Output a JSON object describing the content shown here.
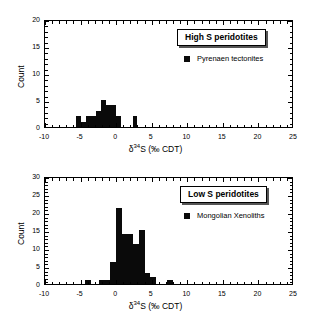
{
  "figure": {
    "background_color": "#ffffff",
    "bar_color": "#0a0a0a"
  },
  "chart_data": [
    {
      "type": "bar",
      "panel": "top",
      "title": "High S peridotites",
      "legend_entries": [
        "Pyrenaen tectonites"
      ],
      "legend_position": "upper-right",
      "xlabel_prefix": "δ",
      "xlabel_sup": "34",
      "xlabel_suffix": "S (‰ CDT)",
      "xlabel": "δ34S (‰ CDT)",
      "ylabel": "Count",
      "xlim": [
        -10,
        25
      ],
      "ylim": [
        0,
        20
      ],
      "xticks": [
        -10,
        -5,
        0,
        5,
        10,
        15,
        20,
        25
      ],
      "yticks": [
        0,
        5,
        10,
        15,
        20
      ],
      "xtick_labels": [
        "-10",
        "-5",
        "0",
        "5",
        "10",
        "15",
        "20",
        "25"
      ],
      "ytick_labels": [
        "0",
        "5",
        "10",
        "15",
        "20"
      ],
      "minor_tick_step_x": 1,
      "minor_tick_step_y": 1,
      "grid": false,
      "bin_width": 0.7,
      "bins": [
        {
          "x0": -5.6,
          "x1": -4.9,
          "value": 2
        },
        {
          "x0": -4.9,
          "x1": -4.2,
          "value": 1
        },
        {
          "x0": -4.2,
          "x1": -3.5,
          "value": 2
        },
        {
          "x0": -3.5,
          "x1": -2.8,
          "value": 2
        },
        {
          "x0": -2.8,
          "x1": -2.1,
          "value": 3
        },
        {
          "x0": -2.1,
          "x1": -1.4,
          "value": 5
        },
        {
          "x0": -1.4,
          "x1": -0.7,
          "value": 4
        },
        {
          "x0": -0.7,
          "x1": 0.0,
          "value": 4
        },
        {
          "x0": 0.0,
          "x1": 0.7,
          "value": 2
        },
        {
          "x0": 2.3,
          "x1": 3.0,
          "value": 2
        }
      ]
    },
    {
      "type": "bar",
      "panel": "bottom",
      "title": "Low S peridotites",
      "legend_entries": [
        "Mongolian Xenoliths"
      ],
      "legend_position": "upper-right",
      "xlabel_prefix": "δ",
      "xlabel_sup": "34",
      "xlabel_suffix": "S (‰ CDT)",
      "xlabel": "δ34S (‰ CDT)",
      "ylabel": "Count",
      "xlim": [
        -10,
        25
      ],
      "ylim": [
        0,
        30
      ],
      "xticks": [
        -10,
        -5,
        0,
        5,
        10,
        15,
        20,
        25
      ],
      "yticks": [
        0,
        5,
        10,
        15,
        20,
        25,
        30
      ],
      "xtick_labels": [
        "-10",
        "-5",
        "0",
        "5",
        "10",
        "15",
        "20",
        "25"
      ],
      "ytick_labels": [
        "0",
        "5",
        "10",
        "15",
        "20",
        "25",
        "30"
      ],
      "minor_tick_step_x": 1,
      "minor_tick_step_y": 1,
      "grid": false,
      "bin_width": 0.8,
      "bins": [
        {
          "x0": -4.4,
          "x1": -3.6,
          "value": 1
        },
        {
          "x0": -2.4,
          "x1": -1.6,
          "value": 1
        },
        {
          "x0": -1.6,
          "x1": -0.8,
          "value": 1
        },
        {
          "x0": -0.8,
          "x1": 0.0,
          "value": 6
        },
        {
          "x0": 0.0,
          "x1": 0.8,
          "value": 21
        },
        {
          "x0": 0.8,
          "x1": 1.6,
          "value": 14
        },
        {
          "x0": 1.6,
          "x1": 2.4,
          "value": 14
        },
        {
          "x0": 2.4,
          "x1": 3.2,
          "value": 11
        },
        {
          "x0": 3.2,
          "x1": 4.0,
          "value": 15
        },
        {
          "x0": 4.0,
          "x1": 4.8,
          "value": 3
        },
        {
          "x0": 4.8,
          "x1": 5.6,
          "value": 2
        },
        {
          "x0": 7.2,
          "x1": 8.0,
          "value": 1
        }
      ]
    }
  ]
}
